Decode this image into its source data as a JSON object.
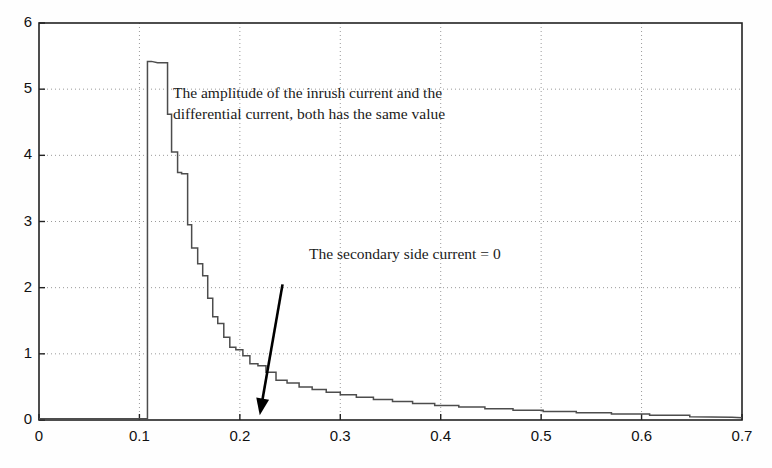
{
  "chart_data": {
    "type": "line",
    "title": "",
    "xlabel": "",
    "ylabel": "",
    "xlim": [
      0,
      0.7
    ],
    "ylim": [
      0,
      6
    ],
    "grid": true,
    "grid_style": "dotted",
    "legend": "none",
    "xticks": [
      "0",
      "0.1",
      "0.2",
      "0.3",
      "0.4",
      "0.5",
      "0.6",
      "0.7"
    ],
    "xtick_values": [
      0,
      0.1,
      0.2,
      0.3,
      0.4,
      0.5,
      0.6,
      0.7
    ],
    "yticks": [
      "0",
      "1",
      "2",
      "3",
      "4",
      "5",
      "6"
    ],
    "ytick_values": [
      0,
      1,
      2,
      3,
      4,
      5,
      6
    ],
    "series": [
      {
        "name": "Inrush / differential current",
        "color": "#4d4d4d",
        "x": [
          0,
          0.02,
          0.04,
          0.06,
          0.08,
          0.1,
          0.105,
          0.108,
          0.108,
          0.112,
          0.118,
          0.124,
          0.128,
          0.128,
          0.132,
          0.132,
          0.138,
          0.138,
          0.142,
          0.142,
          0.148,
          0.148,
          0.152,
          0.152,
          0.158,
          0.158,
          0.163,
          0.163,
          0.168,
          0.168,
          0.173,
          0.173,
          0.178,
          0.178,
          0.184,
          0.184,
          0.19,
          0.19,
          0.196,
          0.196,
          0.203,
          0.203,
          0.21,
          0.21,
          0.218,
          0.218,
          0.226,
          0.226,
          0.236,
          0.236,
          0.247,
          0.247,
          0.259,
          0.259,
          0.272,
          0.272,
          0.286,
          0.286,
          0.3,
          0.3,
          0.316,
          0.316,
          0.333,
          0.333,
          0.352,
          0.352,
          0.372,
          0.372,
          0.394,
          0.394,
          0.418,
          0.418,
          0.444,
          0.444,
          0.472,
          0.472,
          0.502,
          0.502,
          0.535,
          0.535,
          0.57,
          0.57,
          0.608,
          0.608,
          0.648,
          0.648,
          0.69,
          0.7
        ],
        "y": [
          0.02,
          0.02,
          0.02,
          0.02,
          0.02,
          0.02,
          0.02,
          0.02,
          5.42,
          5.42,
          5.4,
          5.4,
          5.4,
          4.62,
          4.62,
          4.05,
          4.05,
          3.74,
          3.74,
          3.72,
          3.72,
          2.95,
          2.95,
          2.6,
          2.6,
          2.36,
          2.36,
          2.18,
          2.18,
          1.84,
          1.84,
          1.56,
          1.56,
          1.46,
          1.46,
          1.25,
          1.25,
          1.1,
          1.1,
          1.06,
          1.06,
          0.97,
          0.97,
          0.85,
          0.85,
          0.82,
          0.82,
          0.72,
          0.72,
          0.6,
          0.6,
          0.56,
          0.56,
          0.5,
          0.5,
          0.46,
          0.46,
          0.42,
          0.42,
          0.38,
          0.38,
          0.345,
          0.345,
          0.31,
          0.31,
          0.28,
          0.28,
          0.25,
          0.25,
          0.22,
          0.22,
          0.195,
          0.195,
          0.17,
          0.17,
          0.148,
          0.148,
          0.128,
          0.128,
          0.11,
          0.11,
          0.09,
          0.09,
          0.07,
          0.07,
          0.05,
          0.04,
          0.035
        ],
        "peak_x": 0.112,
        "peak_y": 5.42
      }
    ],
    "annotations": [
      {
        "name": "amplitude-note",
        "line1": "The amplitude of the inrush current and the",
        "line2": "differential current, both has the same value",
        "x_px": 173,
        "y_px": 82
      },
      {
        "name": "secondary-current-note",
        "text": "The secondary side current = 0",
        "x_px": 309,
        "y_px": 243,
        "arrow": {
          "from_x": 0.2425,
          "from_y": 2.05,
          "to_x": 0.2198,
          "to_y": 0.07
        }
      }
    ]
  },
  "colors": {
    "axis": "#222222",
    "grid": "#9a9a9a",
    "curve": "#4d4d4d",
    "arrow": "#000000",
    "text": "#1a1a1a",
    "background": "#fefefe"
  }
}
